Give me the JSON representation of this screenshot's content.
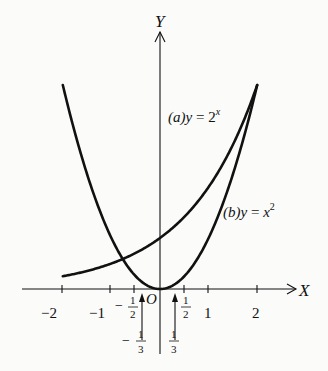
{
  "chart_data": {
    "type": "line",
    "title": "",
    "xlabel": "X",
    "ylabel": "Y",
    "origin_label": "O",
    "xlim": [
      -2,
      2
    ],
    "ylim": [
      0,
      4
    ],
    "grid": false,
    "x_ticks": [
      "-2",
      "-1",
      "-1/2",
      "1/2",
      "1",
      "2"
    ],
    "x_tick_values": [
      -2,
      -1,
      -0.5,
      0.5,
      1,
      2
    ],
    "markers": [
      {
        "x": -0.3333,
        "label": "-1/3",
        "arrow": "up"
      },
      {
        "x": 0.3333,
        "label": "1/3",
        "arrow": "up"
      }
    ],
    "series": [
      {
        "name": "(a) y = 2^x",
        "label_parts": {
          "prefix": "(a)",
          "lhs": "y",
          "eq": " = ",
          "base": "2",
          "exp": "x"
        },
        "x": [
          -2,
          -1.5,
          -1,
          -0.5,
          0,
          0.5,
          1,
          1.5,
          2
        ],
        "values": [
          0.25,
          0.354,
          0.5,
          0.707,
          1,
          1.414,
          2,
          2.828,
          4
        ]
      },
      {
        "name": "(b) y = x^2",
        "label_parts": {
          "prefix": "(b)",
          "lhs": "y",
          "eq": " = ",
          "base": "x",
          "exp": "2"
        },
        "x": [
          -2,
          -1.5,
          -1,
          -0.5,
          0,
          0.5,
          1,
          1.5,
          2
        ],
        "values": [
          4,
          2.25,
          1,
          0.25,
          0,
          0.25,
          1,
          2.25,
          4
        ]
      }
    ],
    "annotations": [
      "Intersection near x ≈ -0.77",
      "Intersection at x = 2"
    ]
  },
  "labels": {
    "y_axis": "Y",
    "x_axis": "X",
    "origin": "O",
    "tick_m2": "−2",
    "tick_m1": "−1",
    "tick_p1": "1",
    "tick_p2": "2",
    "half_num": "1",
    "half_den": "2",
    "third_num": "1",
    "third_den": "3",
    "minus": "−",
    "series_a_prefix": "(a)",
    "series_a_lhs": "y",
    "series_a_eq": " = ",
    "series_a_base": "2",
    "series_a_exp": "x",
    "series_b_prefix": "(b)",
    "series_b_lhs": "y",
    "series_b_eq": " = ",
    "series_b_base": "x",
    "series_b_exp": "2"
  }
}
